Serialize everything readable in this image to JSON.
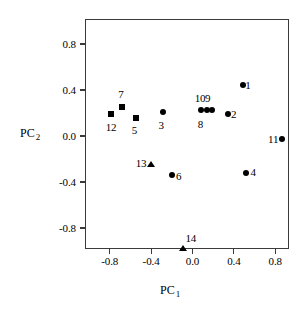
{
  "chart_data": {
    "type": "scatter",
    "title": "",
    "xlabel": "PC 1",
    "ylabel": "PC 2",
    "xlabel_base": "PC",
    "xlabel_sub": "1",
    "ylabel_base": "PC",
    "ylabel_sub": "2",
    "xlim": [
      -1.0,
      1.0
    ],
    "ylim": [
      -1.0,
      1.0
    ],
    "grid": false,
    "legend": "none",
    "xticks": [
      -0.8,
      -0.4,
      0.0,
      0.4,
      0.8
    ],
    "yticks": [
      -0.8,
      -0.4,
      0.0,
      0.4,
      0.8
    ],
    "xticklabels": [
      "-0.8",
      "-0.4",
      "0.0",
      "0.4",
      "0.8"
    ],
    "yticklabels": [
      "-0.8",
      "-0.4",
      "0.0",
      "0.4",
      "0.8"
    ],
    "series": [
      {
        "name": "circles",
        "marker": "circle",
        "points": [
          {
            "label": "1",
            "x": 0.49,
            "y": 0.44,
            "lx": 0.55,
            "ly": 0.44
          },
          {
            "label": "2",
            "x": 0.34,
            "y": 0.19,
            "lx": 0.41,
            "ly": 0.19
          },
          {
            "label": "3",
            "x": -0.29,
            "y": 0.21,
            "lx": -0.29,
            "ly": 0.09
          },
          {
            "label": "4",
            "x": 0.52,
            "y": -0.32,
            "lx": 0.6,
            "ly": -0.32
          },
          {
            "label": "6",
            "x": -0.2,
            "y": -0.34,
            "lx": -0.12,
            "ly": -0.35
          },
          {
            "label": "8",
            "x": 0.08,
            "y": 0.23,
            "lx": 0.09,
            "ly": 0.1
          },
          {
            "label": "9",
            "x": 0.14,
            "y": 0.23,
            "lx": 0.16,
            "ly": 0.33
          },
          {
            "label": "10",
            "x": 0.19,
            "y": 0.23,
            "lx": 0.06,
            "ly": 0.33
          },
          {
            "label": "11",
            "x": 0.87,
            "y": -0.03,
            "lx": 0.77,
            "ly": -0.03
          }
        ]
      },
      {
        "name": "squares",
        "marker": "square",
        "points": [
          {
            "label": "5",
            "x": -0.55,
            "y": 0.16,
            "lx": -0.55,
            "ly": 0.05
          },
          {
            "label": "7",
            "x": -0.68,
            "y": 0.25,
            "lx": -0.68,
            "ly": 0.36
          },
          {
            "label": "12",
            "x": -0.79,
            "y": 0.19,
            "lx": -0.8,
            "ly": 0.07
          }
        ]
      },
      {
        "name": "triangles",
        "marker": "triangle",
        "points": [
          {
            "label": "13",
            "x": -0.4,
            "y": -0.25,
            "lx": -0.51,
            "ly": -0.24
          },
          {
            "label": "14",
            "x": -0.09,
            "y": -0.98,
            "lx": -0.03,
            "ly": -0.89
          }
        ]
      }
    ]
  },
  "colors": {
    "axis": "#3a3a3a",
    "marker": "#000000",
    "background": "#ffffff"
  }
}
